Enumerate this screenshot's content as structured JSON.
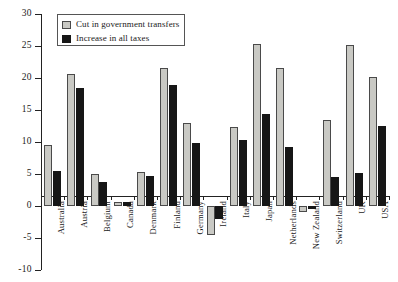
{
  "chart_data": {
    "type": "bar",
    "title": "",
    "subtitle": "",
    "xlabel": "",
    "ylabel": "",
    "ylim": [
      -10,
      30
    ],
    "ytick_values": [
      30,
      25,
      20,
      15,
      10,
      5,
      0,
      -5,
      -10
    ],
    "ytick_labels": [
      "30",
      "25",
      "20",
      "15",
      "10",
      "5",
      "0",
      "-5",
      "-10"
    ],
    "grid": false,
    "legend_position": "top-left",
    "categories": [
      "Australia",
      "Austria",
      "Belgium",
      "Canada",
      "Denmark",
      "Finland",
      "Germany",
      "Ireland",
      "Italy",
      "Japan",
      "Netherlands",
      "New Zealand",
      "Switzerland",
      "UK",
      "USA"
    ],
    "series": [
      {
        "name": "Cut in government transfers",
        "color": "#c9c9c4",
        "values": [
          9.5,
          20.7,
          5.0,
          0.6,
          5.3,
          21.5,
          13.0,
          -4.5,
          12.3,
          25.3,
          21.5,
          -1.0,
          13.5,
          25.2,
          20.1
        ]
      },
      {
        "name": "Increase in all taxes",
        "color": "#161616",
        "values": [
          5.4,
          18.4,
          3.7,
          0.6,
          4.7,
          18.9,
          9.8,
          -2.0,
          10.3,
          14.3,
          9.2,
          -0.5,
          4.6,
          5.1,
          12.5
        ]
      }
    ]
  },
  "legend": {
    "items": [
      {
        "label": "Cut in government transfers",
        "swatch": "grey"
      },
      {
        "label": "Increase in all taxes",
        "swatch": "dark"
      }
    ]
  }
}
